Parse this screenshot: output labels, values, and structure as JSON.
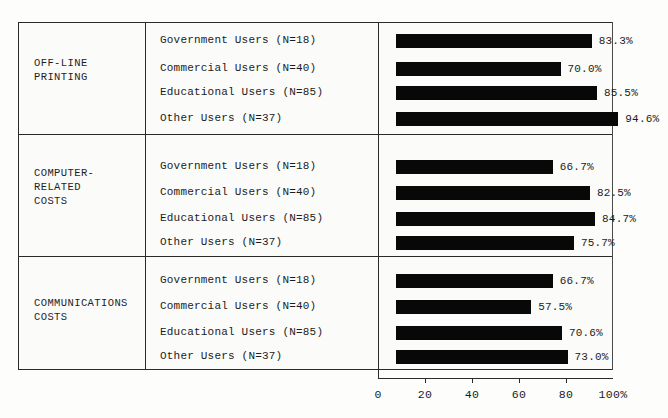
{
  "chart_data": {
    "type": "bar",
    "orientation": "horizontal",
    "title": "",
    "xlabel": "",
    "ylabel": "",
    "xlim": [
      0,
      100
    ],
    "xticks": [
      0,
      20,
      40,
      60,
      80,
      100
    ],
    "xtick_labels": [
      "0",
      "20",
      "40",
      "60",
      "80",
      "100%"
    ],
    "grid": false,
    "legend": "none",
    "value_suffix": "%",
    "bar_color": "#080808",
    "frame_color": "#2a2a2a",
    "groups": [
      {
        "category": "OFF-LINE\nPRINTING",
        "rows": [
          {
            "label": "Government Users  (N=18)",
            "value": 83.3,
            "value_label": "83.3%"
          },
          {
            "label": "Commercial Users  (N=40)",
            "value": 70.0,
            "value_label": "70.0%"
          },
          {
            "label": "Educational Users  (N=85)",
            "value": 85.5,
            "value_label": "85.5%"
          },
          {
            "label": "Other Users  (N=37)",
            "value": 94.6,
            "value_label": "94.6%"
          }
        ]
      },
      {
        "category": "COMPUTER-\nRELATED\nCOSTS",
        "rows": [
          {
            "label": "Government Users  (N=18)",
            "value": 66.7,
            "value_label": "66.7%"
          },
          {
            "label": "Commercial Users  (N=40)",
            "value": 82.5,
            "value_label": "82.5%"
          },
          {
            "label": "Educational Users  (N=85)",
            "value": 84.7,
            "value_label": "84.7%"
          },
          {
            "label": "Other Users  (N=37)",
            "value": 75.7,
            "value_label": "75.7%"
          }
        ]
      },
      {
        "category": "COMMUNICATIONS\nCOSTS",
        "rows": [
          {
            "label": "Government Users  (N=18)",
            "value": 66.7,
            "value_label": "66.7%"
          },
          {
            "label": "Commercial Users  (N=40)",
            "value": 57.5,
            "value_label": "57.5%"
          },
          {
            "label": "Educational Users  (N=85)",
            "value": 70.6,
            "value_label": "70.6%"
          },
          {
            "label": "Other Users  (N=37)",
            "value": 73.0,
            "value_label": "73.0%"
          }
        ]
      }
    ]
  }
}
